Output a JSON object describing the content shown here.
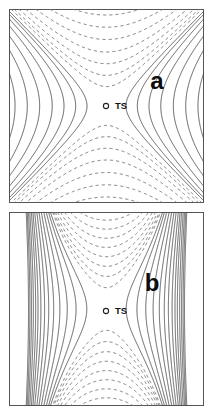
{
  "figure": {
    "title": "",
    "background": "#ffffff",
    "panel_count": 2
  },
  "panels": [
    {
      "id": "a",
      "letter": "a",
      "letter_x": 148,
      "letter_y": 74,
      "marker_label": "TS",
      "marker_x": 97,
      "marker_y": 97,
      "label_offset_x": 9,
      "frame_color": "#555555",
      "solid_color": "#4d4d4d",
      "dashed_color": "#6e6e6e"
    },
    {
      "id": "b",
      "letter": "b",
      "letter_x": 143,
      "letter_y": 73,
      "marker_label": "TS",
      "marker_x": 97,
      "marker_y": 99,
      "label_offset_x": 9,
      "frame_color": "#555555",
      "solid_color": "#4d4d4d",
      "dashed_color": "#6e6e6e"
    }
  ],
  "chart_data": [
    {
      "type": "contour",
      "panel": "a",
      "title": "",
      "xlabel": "",
      "ylabel": "",
      "xlim": [
        -1,
        1
      ],
      "ylim": [
        -1,
        1
      ],
      "grid": false,
      "legend": null,
      "function": "saddle",
      "surface": "z = (x^2 - y^2) scaled; hyperbolic saddle / first-order transition state",
      "critical_point": {
        "label": "TS",
        "x": 0.0,
        "y": 0.0,
        "type": "saddle"
      },
      "aspect_x": 1.0,
      "aspect_y": 1.0,
      "solid_levels": [
        0.04,
        0.1,
        0.19,
        0.31,
        0.47,
        0.66,
        0.88
      ],
      "dashed_levels": [
        -0.04,
        -0.1,
        -0.19,
        -0.31,
        -0.47,
        -0.66,
        -0.88
      ],
      "solid_meaning": "positive levels (reactant/product valleys), drawn solid",
      "dashed_meaning": "negative levels (downhill along reaction coordinate), drawn dashed",
      "annotations": [
        {
          "text": "a",
          "x": 0.44,
          "y": 0.24
        },
        {
          "text": "TS",
          "x": 0.02,
          "y": 0.0
        }
      ]
    },
    {
      "type": "contour",
      "panel": "b",
      "title": "",
      "xlabel": "",
      "ylabel": "",
      "xlim": [
        -1,
        1
      ],
      "ylim": [
        -1,
        1
      ],
      "grid": false,
      "legend": null,
      "function": "anisotropic-saddle",
      "surface": "strongly anisotropic saddle; contours compressed into a narrow vertical channel through TS",
      "critical_point": {
        "label": "TS",
        "x": 0.0,
        "y": 0.0,
        "type": "saddle"
      },
      "aspect_x": 0.22,
      "aspect_y": 1.0,
      "solid_levels": [
        0.05,
        0.13,
        0.24,
        0.38,
        0.55,
        0.74,
        0.95,
        1.2,
        1.45,
        1.7,
        2.0,
        2.3,
        2.6,
        2.9
      ],
      "dashed_levels": [
        -0.03,
        -0.07,
        -0.12,
        -0.18,
        -0.25,
        -0.33,
        -0.42,
        -0.52
      ],
      "solid_meaning": "positive levels, steep flanking walls producing dense diagonal fringes at the corners",
      "dashed_meaning": "negative levels confined to a narrow vertical band above and below TS",
      "annotations": [
        {
          "text": "b",
          "x": 0.42,
          "y": 0.25
        },
        {
          "text": "TS",
          "x": 0.02,
          "y": 0.0
        }
      ]
    }
  ]
}
